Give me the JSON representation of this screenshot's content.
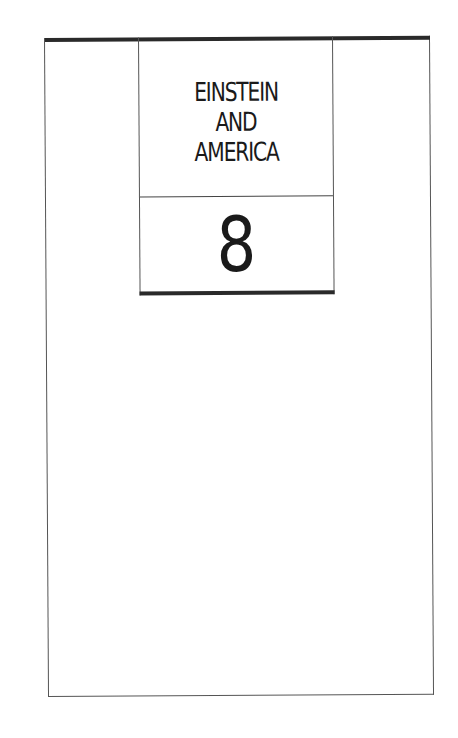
{
  "page": {
    "title_lines": [
      "EINSTEIN",
      "AND",
      "AMERICA"
    ],
    "chapter_number": "8"
  },
  "colors": {
    "ink": "#1a1a1a",
    "rule": "#2a2a2a",
    "paper": "#ffffff"
  }
}
